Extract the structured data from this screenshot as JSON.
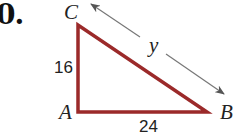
{
  "problem": {
    "number": "0."
  },
  "triangle": {
    "vertices": {
      "A": {
        "label": "A"
      },
      "B": {
        "label": "B"
      },
      "C": {
        "label": "C"
      }
    },
    "sides": {
      "AC": {
        "label": "16"
      },
      "AB": {
        "label": "24"
      },
      "BC": {
        "label": "y"
      }
    },
    "stroke_color": "#9b2a2a",
    "arrow_color": "#777777"
  }
}
